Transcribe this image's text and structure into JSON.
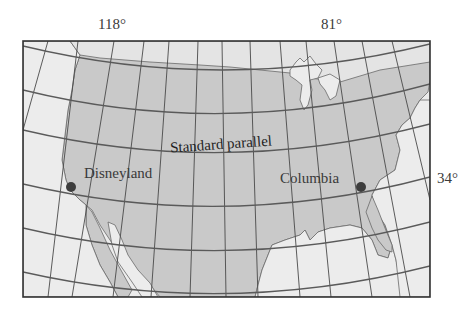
{
  "map": {
    "title": "Conic projection of the contiguous United States with standard parallel",
    "projection": "conic",
    "colors": {
      "land": "#c9c9c9",
      "water": "#ececec",
      "grid": "#4a4a4a",
      "standard_parallel": "#5a5a5a",
      "frame": "#333333",
      "point": "#3d3d3d",
      "text": "#3a3a3a"
    },
    "meridian_labels": [
      {
        "label": "118°",
        "longitude": 118
      },
      {
        "label": "81°",
        "longitude": 81
      }
    ],
    "parallel_labels": [
      {
        "label": "34°",
        "latitude": 34
      }
    ],
    "standard_parallel": {
      "label": "Standard parallel"
    },
    "points": [
      {
        "name": "Disneyland",
        "label": "Disneyland",
        "latitude": 34,
        "longitude": 118
      },
      {
        "name": "Columbia",
        "label": "Columbia",
        "latitude": 34,
        "longitude": 81
      }
    ]
  }
}
